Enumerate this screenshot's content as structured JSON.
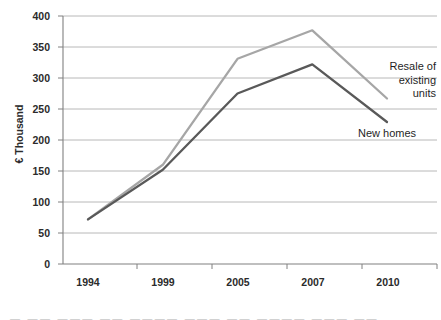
{
  "chart_data": {
    "type": "line",
    "title": "",
    "xlabel": "",
    "ylabel": "€ Thousand",
    "categories": [
      "1994",
      "1999",
      "2005",
      "2007",
      "2010"
    ],
    "ylim": [
      0,
      400
    ],
    "yticks": [
      0,
      50,
      100,
      150,
      200,
      250,
      300,
      350,
      400
    ],
    "grid": true,
    "legend_position": "inline-right",
    "series": [
      {
        "name": "Resale of existing units",
        "color": "#a6a6a6",
        "values": [
          72,
          160,
          331,
          377,
          267
        ]
      },
      {
        "name": "New homes",
        "color": "#595959",
        "values": [
          72,
          152,
          275,
          322,
          229
        ]
      }
    ],
    "annotations": [
      {
        "id": "resale",
        "lines": [
          "Resale of",
          "existing",
          "units"
        ]
      },
      {
        "id": "newhomes",
        "lines": [
          "New homes"
        ]
      }
    ]
  },
  "axis": {
    "y_title": "€ Thousand",
    "y_tick_labels": [
      "400",
      "350",
      "300",
      "250",
      "200",
      "150",
      "100",
      "50",
      "0"
    ],
    "x_tick_labels": [
      "1994",
      "1999",
      "2005",
      "2007",
      "2010"
    ]
  },
  "labels": {
    "resale_line1": "Resale of",
    "resale_line2": "existing",
    "resale_line3": "units",
    "new_homes": "New homes"
  },
  "colors": {
    "resale_line": "#a6a6a6",
    "new_homes_line": "#595959",
    "gridline": "#a6a6a6",
    "axis": "#808080",
    "text": "#2b2b2b"
  },
  "footer": {
    "cropped_text": "—  ——  ———  ——  ————  ———  ——  ————  ———  ——"
  }
}
